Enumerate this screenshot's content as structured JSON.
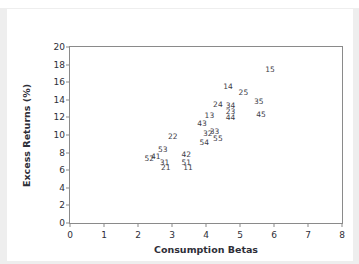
{
  "chart_data": {
    "type": "scatter",
    "title": "",
    "xlabel": "Consumption Betas",
    "ylabel": "Excess Returns (%)",
    "xlim": [
      0,
      8
    ],
    "ylim": [
      0,
      20
    ],
    "xticks": [
      0,
      1,
      2,
      3,
      4,
      5,
      6,
      7,
      8
    ],
    "yticks": [
      0,
      2,
      4,
      6,
      8,
      10,
      12,
      14,
      16,
      18,
      20
    ],
    "grid": false,
    "legend": null,
    "marker_style": "text-label",
    "note": "Each data point is drawn as its two-digit portfolio number instead of a marker symbol.",
    "points": [
      {
        "label": "52",
        "x": 2.33,
        "y": 7.25
      },
      {
        "label": "41",
        "x": 2.52,
        "y": 7.55
      },
      {
        "label": "53",
        "x": 2.73,
        "y": 8.25
      },
      {
        "label": "31",
        "x": 2.78,
        "y": 6.85
      },
      {
        "label": "21",
        "x": 2.82,
        "y": 6.25
      },
      {
        "label": "22",
        "x": 3.02,
        "y": 9.75
      },
      {
        "label": "42",
        "x": 3.42,
        "y": 7.75
      },
      {
        "label": "51",
        "x": 3.42,
        "y": 6.85
      },
      {
        "label": "11",
        "x": 3.47,
        "y": 6.25
      },
      {
        "label": "43",
        "x": 3.88,
        "y": 11.3
      },
      {
        "label": "54",
        "x": 3.95,
        "y": 9.1
      },
      {
        "label": "32",
        "x": 4.05,
        "y": 10.1
      },
      {
        "label": "33",
        "x": 4.25,
        "y": 10.3
      },
      {
        "label": "13",
        "x": 4.1,
        "y": 12.2
      },
      {
        "label": "55",
        "x": 4.35,
        "y": 9.6
      },
      {
        "label": "24",
        "x": 4.35,
        "y": 13.4
      },
      {
        "label": "34",
        "x": 4.72,
        "y": 13.3
      },
      {
        "label": "23",
        "x": 4.72,
        "y": 12.6
      },
      {
        "label": "44",
        "x": 4.72,
        "y": 11.9
      },
      {
        "label": "14",
        "x": 4.65,
        "y": 15.4
      },
      {
        "label": "25",
        "x": 5.1,
        "y": 14.8
      },
      {
        "label": "35",
        "x": 5.55,
        "y": 13.8
      },
      {
        "label": "45",
        "x": 5.62,
        "y": 12.3
      },
      {
        "label": "15",
        "x": 5.88,
        "y": 17.4
      }
    ]
  }
}
